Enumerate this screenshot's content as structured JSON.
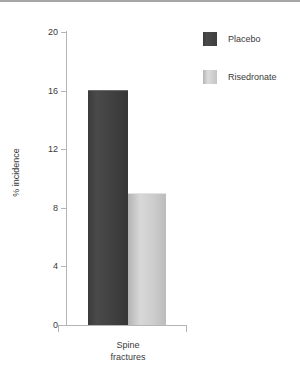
{
  "chart_data": {
    "type": "bar",
    "title": "",
    "subtitle": "",
    "xlabel": "Spine fractures",
    "ylabel": "% incidence",
    "categories": [
      "Spine fractures"
    ],
    "category_label_lines": [
      "Spine",
      "fractures"
    ],
    "series": [
      {
        "name": "Placebo",
        "values": [
          16
        ],
        "color": "#424242"
      },
      {
        "name": "Risedronate",
        "values": [
          9
        ],
        "color": "#c8c8c8"
      }
    ],
    "ylim": [
      0,
      20
    ],
    "ytick_values": [
      20,
      16,
      12,
      8,
      4,
      0
    ],
    "ytick_labels": [
      "20",
      "16",
      "12",
      "8",
      "4",
      "0"
    ],
    "grid": false,
    "legend_position": "top-right",
    "legend_entries": [
      "Placebo",
      "Risedronate"
    ]
  },
  "axis": {
    "y_title": "% incidence",
    "ticks": [
      {
        "label": "20",
        "value": 20
      },
      {
        "label": "16",
        "value": 16
      },
      {
        "label": "12",
        "value": 12
      },
      {
        "label": "8",
        "value": 8
      },
      {
        "label": "4",
        "value": 4
      },
      {
        "label": "0",
        "value": 0
      }
    ]
  },
  "legend": {
    "items": [
      {
        "label": "Placebo",
        "swatch": "dark"
      },
      {
        "label": "Risedronate",
        "swatch": "light"
      }
    ]
  },
  "x_category": {
    "line1": "Spine",
    "line2": "fractures"
  }
}
